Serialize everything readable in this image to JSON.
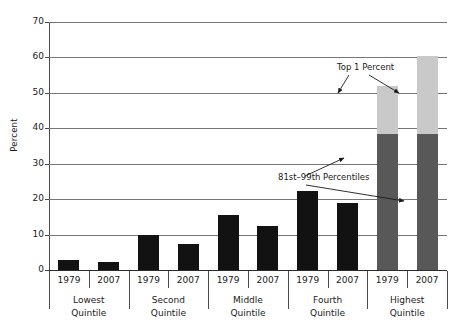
{
  "chart_data": {
    "type": "bar",
    "title": "",
    "xlabel": "",
    "ylabel": "Percent",
    "ylim": [
      0,
      70
    ],
    "yticks": [
      0,
      10,
      20,
      30,
      40,
      50,
      60,
      70
    ],
    "grid": true,
    "legend": "none",
    "stacked_group": "Highest Quintile",
    "categories": [
      "Lowest Quintile",
      "Second Quintile",
      "Middle Quintile",
      "Fourth Quintile",
      "Highest Quintile"
    ],
    "x": [
      "1979",
      "2007",
      "1979",
      "2007",
      "1979",
      "2007",
      "1979",
      "2007",
      "1979",
      "2007"
    ],
    "groups": [
      {
        "label_line1": "Lowest",
        "label_line2": "Quintile",
        "bars": [
          {
            "year": "1979",
            "value": 2.8,
            "segments": [
              {
                "name": "share",
                "value": 2.8,
                "color": "#121212"
              }
            ]
          },
          {
            "year": "2007",
            "value": 2.4,
            "segments": [
              {
                "name": "share",
                "value": 2.4,
                "color": "#121212"
              }
            ]
          }
        ]
      },
      {
        "label_line1": "Second",
        "label_line2": "Quintile",
        "bars": [
          {
            "year": "1979",
            "value": 10.0,
            "segments": [
              {
                "name": "share",
                "value": 10.0,
                "color": "#121212"
              }
            ]
          },
          {
            "year": "2007",
            "value": 7.4,
            "segments": [
              {
                "name": "share",
                "value": 7.4,
                "color": "#121212"
              }
            ]
          }
        ]
      },
      {
        "label_line1": "Middle",
        "label_line2": "Quintile",
        "bars": [
          {
            "year": "1979",
            "value": 15.5,
            "segments": [
              {
                "name": "share",
                "value": 15.5,
                "color": "#121212"
              }
            ]
          },
          {
            "year": "2007",
            "value": 12.4,
            "segments": [
              {
                "name": "share",
                "value": 12.4,
                "color": "#121212"
              }
            ]
          }
        ]
      },
      {
        "label_line1": "Fourth",
        "label_line2": "Quintile",
        "bars": [
          {
            "year": "1979",
            "value": 22.4,
            "segments": [
              {
                "name": "share",
                "value": 22.4,
                "color": "#121212"
              }
            ]
          },
          {
            "year": "2007",
            "value": 19.0,
            "segments": [
              {
                "name": "share",
                "value": 19.0,
                "color": "#121212"
              }
            ]
          }
        ]
      },
      {
        "label_line1": "Highest",
        "label_line2": "Quintile",
        "bars": [
          {
            "year": "1979",
            "value": 52.0,
            "segments": [
              {
                "name": "81st-99th Percentiles",
                "value": 38.5,
                "color": "#585858"
              },
              {
                "name": "Top 1 Percent",
                "value": 13.5,
                "color": "#c9c9c9"
              }
            ]
          },
          {
            "year": "2007",
            "value": 60.5,
            "segments": [
              {
                "name": "81st-99th Percentiles",
                "value": 38.5,
                "color": "#585858"
              },
              {
                "name": "Top 1 Percent",
                "value": 22.0,
                "color": "#c9c9c9"
              }
            ]
          }
        ]
      }
    ],
    "annotations": [
      {
        "id": "top1",
        "text": "Top 1 Percent",
        "points_to": [
          "Highest Quintile 1979 top segment",
          "Highest Quintile 2007 top segment"
        ]
      },
      {
        "id": "p81_99",
        "text": "81st–99th Percentiles",
        "points_to": [
          "Highest Quintile 1979 lower segment",
          "Highest Quintile 2007 lower segment"
        ]
      }
    ],
    "colors": {
      "bar_dark": "#121212",
      "segment_81_99": "#585858",
      "segment_top1": "#c9c9c9",
      "gridline": "#767676",
      "axis": "#4a4a4a",
      "text": "#1a1a1a",
      "background": "#ffffff"
    }
  },
  "axis": {
    "y_title": "Percent",
    "y_labels": [
      "70",
      "60",
      "50",
      "40",
      "30",
      "20",
      "10",
      "0"
    ]
  }
}
